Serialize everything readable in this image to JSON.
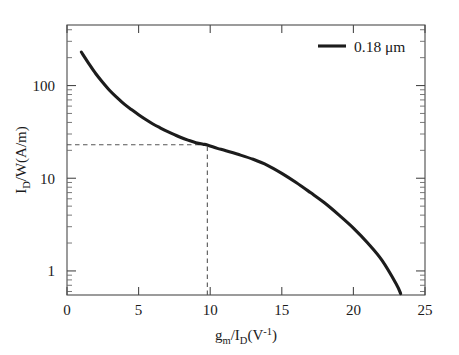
{
  "chart_data": {
    "type": "line",
    "title": "",
    "xlabel": "g_m / I_D (V^-1)",
    "ylabel": "I_D /W (A/m)",
    "xlabel_parts": {
      "g": "g",
      "m": "m",
      "slash": "/",
      "I": "I",
      "D": "D",
      "unit_open": "(V",
      "exp": "-1",
      "unit_close": ")"
    },
    "ylabel_parts": {
      "I": "I",
      "D": "D",
      "w": "/W",
      "unit": "(A/m)"
    },
    "xlim": [
      0,
      25
    ],
    "ylim": [
      0.55,
      450
    ],
    "yscale": "log",
    "xscale": "linear",
    "grid": false,
    "xticks": [
      "0",
      "5",
      "10",
      "15",
      "20",
      "25"
    ],
    "xtick_values": [
      0,
      5,
      10,
      15,
      20,
      25
    ],
    "yticks": [
      "100",
      "10",
      "1"
    ],
    "ytick_values": [
      100,
      10,
      1
    ],
    "legend_position": "top-right",
    "legend": [
      {
        "label": "0.18 μm",
        "color": "#1c1c1c"
      }
    ],
    "series": [
      {
        "name": "0.18 μm",
        "color": "#1c1c1c",
        "x": [
          1.0,
          1.5,
          2.0,
          2.5,
          3.0,
          3.5,
          4.0,
          4.5,
          5.0,
          5.5,
          6.0,
          6.5,
          7.0,
          7.5,
          8.0,
          8.5,
          9.0,
          9.5,
          9.8,
          10.5,
          11.0,
          12.0,
          13.0,
          14.0,
          15.0,
          16.0,
          17.0,
          18.0,
          19.0,
          20.0,
          21.0,
          22.0,
          23.0,
          23.3
        ],
        "y": [
          230.0,
          175.0,
          135.0,
          108.0,
          88.0,
          74.0,
          63.0,
          55.0,
          48.5,
          43.0,
          38.5,
          35.0,
          32.0,
          29.5,
          27.3,
          25.6,
          24.2,
          23.3,
          22.9,
          21.0,
          20.0,
          18.0,
          16.0,
          13.8,
          11.3,
          9.0,
          7.0,
          5.4,
          4.0,
          2.9,
          2.0,
          1.3,
          0.72,
          0.57
        ]
      }
    ],
    "annotations": [
      {
        "type": "guide-horizontal",
        "y": 23.0,
        "x_from": 0,
        "x_to": 9.8,
        "style": "dashed"
      },
      {
        "type": "guide-vertical",
        "x": 9.8,
        "y_from": 0.55,
        "y_to": 23.0,
        "style": "dashed"
      }
    ]
  }
}
